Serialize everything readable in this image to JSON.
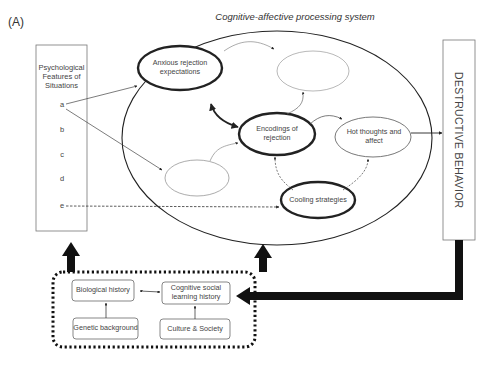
{
  "panel_label": "(A)",
  "title": "Cognitive-affective processing system",
  "situations_box": {
    "heading": "Psychological Features of Situations",
    "features": [
      "a",
      "b",
      "c",
      "d",
      "e"
    ]
  },
  "cognitive_units": {
    "anxious_rejection": "Anxious rejection expectations",
    "encodings": "Encodings of rejection",
    "hot_thoughts": "Hot thoughts and affect",
    "cooling": "Cooling strategies",
    "empty_top": "",
    "empty_left": ""
  },
  "outcome": "DESTRUCTIVE BEHAVIOR",
  "history_box": {
    "biological": "Biological history",
    "cognitive_social": "Cognitive social learning history",
    "genetic": "Genetic background",
    "culture": "Culture & Society"
  },
  "colors": {
    "line": "#333333",
    "thin_line": "#888888",
    "text": "#444444",
    "background": "#ffffff"
  }
}
